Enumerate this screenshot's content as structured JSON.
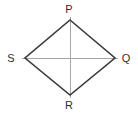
{
  "figure": {
    "name": "rhombus-pqrs-with-diagonals",
    "type": "geometry-diagram",
    "shape": "rhombus",
    "canvas": {
      "width": 138,
      "height": 114,
      "background": "#ffffff"
    },
    "styles": {
      "outline_color": "#3a3a3a",
      "outline_width": 1.6,
      "diagonal_color": "#a6a6a6",
      "diagonal_width": 1,
      "label_color": "#2f2f2f",
      "label_font_size": 11
    },
    "vertices": [
      {
        "id": "P",
        "label": "P",
        "x": 70,
        "y": 20,
        "label_x": 69,
        "label_y": 9,
        "position": "top"
      },
      {
        "id": "Q",
        "label": "Q",
        "x": 115,
        "y": 58,
        "label_x": 126,
        "label_y": 58,
        "position": "right"
      },
      {
        "id": "R",
        "label": "R",
        "x": 70,
        "y": 95,
        "label_x": 69,
        "label_y": 105,
        "position": "bottom"
      },
      {
        "id": "S",
        "label": "S",
        "x": 25,
        "y": 58,
        "label_x": 11,
        "label_y": 58,
        "position": "left"
      }
    ],
    "edges": [
      {
        "from": "S",
        "to": "P"
      },
      {
        "from": "P",
        "to": "Q"
      },
      {
        "from": "Q",
        "to": "R"
      },
      {
        "from": "R",
        "to": "S"
      }
    ],
    "diagonals": [
      {
        "id": "SQ",
        "from": "S",
        "to": "Q",
        "x1": 22,
        "y1": 58,
        "x2": 118,
        "y2": 58
      },
      {
        "id": "PR",
        "from": "P",
        "to": "R",
        "x1": 70,
        "y1": 17,
        "x2": 70,
        "y2": 98
      }
    ],
    "outline_path": "M 70 20 L 115 58 L 70 95 L 25 58 Z"
  }
}
